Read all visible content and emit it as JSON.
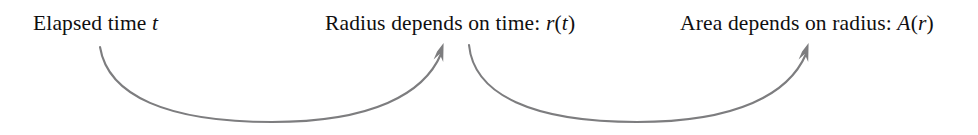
{
  "figure": {
    "background_color": "#ffffff",
    "text_color": "#100f10",
    "arrow_color": "#7d7d7f",
    "width": 978,
    "height": 135
  },
  "labels": {
    "elapsed_time": {
      "prefix": "Elapsed time ",
      "variable": "t",
      "suffix": "",
      "full_text": "Elapsed time t"
    },
    "radius_of_time": {
      "prefix": "Radius depends on time: ",
      "variable": "r",
      "open_paren": "(",
      "argument": "t",
      "close_paren": ")",
      "full_text": "Radius depends on time: r(t)"
    },
    "area_of_radius": {
      "prefix": "Area depends on radius: ",
      "variable": "A",
      "open_paren": "(",
      "argument": "r",
      "close_paren": ")",
      "full_text": "Area depends on radius: A(r)"
    }
  },
  "arrows": [
    {
      "name": "time-to-radius-arrow",
      "from": "elapsed_time",
      "to": "radius_of_time",
      "start_x": 100,
      "start_y": 47,
      "end_x": 443,
      "end_y": 48,
      "dip_y": 122
    },
    {
      "name": "radius-to-area-arrow",
      "from": "radius_of_time",
      "to": "area_of_radius",
      "start_x": 469,
      "start_y": 45,
      "end_x": 808,
      "end_y": 48,
      "dip_y": 122
    }
  ]
}
